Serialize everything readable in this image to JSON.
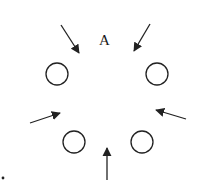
{
  "diagram": {
    "label": "A",
    "stroke_color": "#222222",
    "circles": [
      {
        "name": "circle-upper-left",
        "cx": 57,
        "cy": 74,
        "r": 11
      },
      {
        "name": "circle-upper-right",
        "cx": 157,
        "cy": 74,
        "r": 11
      },
      {
        "name": "circle-lower-left",
        "cx": 74,
        "cy": 142,
        "r": 11
      },
      {
        "name": "circle-lower-right",
        "cx": 142,
        "cy": 142,
        "r": 11
      }
    ],
    "arrows": [
      {
        "name": "arrow-top-left",
        "x1": 61,
        "y1": 25,
        "x2": 79,
        "y2": 53
      },
      {
        "name": "arrow-top-right",
        "x1": 150,
        "y1": 24,
        "x2": 134,
        "y2": 51
      },
      {
        "name": "arrow-mid-left",
        "x1": 30,
        "y1": 123,
        "x2": 60,
        "y2": 113
      },
      {
        "name": "arrow-mid-right",
        "x1": 186,
        "y1": 119,
        "x2": 156,
        "y2": 110
      },
      {
        "name": "arrow-bottom",
        "x1": 107,
        "y1": 180,
        "x2": 107,
        "y2": 148
      }
    ],
    "dot": {
      "cx": 3,
      "cy": 178,
      "r": 1.4
    }
  }
}
